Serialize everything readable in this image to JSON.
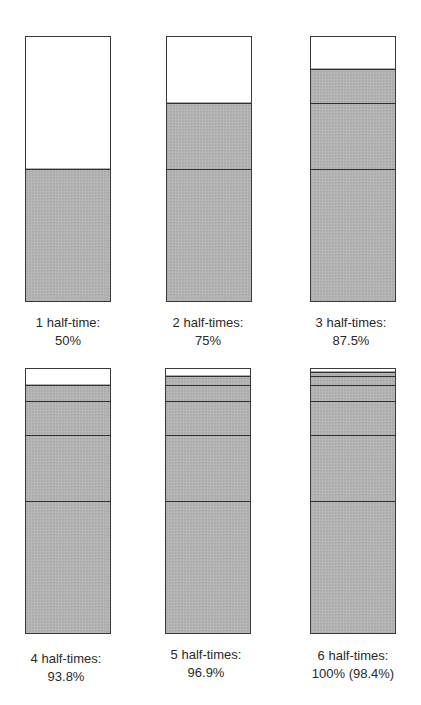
{
  "diagram": {
    "colors": {
      "filled": "#b4b4b4",
      "empty": "#ffffff",
      "line": "#2f2f2f"
    },
    "panels": [
      {
        "label_line1": "1 half-time:",
        "label_line2": "50%",
        "segments": [
          50
        ]
      },
      {
        "label_line1": "2 half-times:",
        "label_line2": "75%",
        "segments": [
          50,
          25
        ]
      },
      {
        "label_line1": "3 half-times:",
        "label_line2": "87.5%",
        "segments": [
          50,
          25,
          12.5
        ]
      },
      {
        "label_line1": "4 half-times:",
        "label_line2": "93.8%",
        "segments": [
          50,
          25,
          12.5,
          6.25
        ]
      },
      {
        "label_line1": "5 half-times:",
        "label_line2": "96.9%",
        "segments": [
          50,
          25,
          12.5,
          6.25,
          3.125
        ]
      },
      {
        "label_line1": "6 half-times:",
        "label_line2": "100% (98.4%)",
        "segments": [
          50,
          25,
          12.5,
          6.25,
          3.125,
          1.5625
        ]
      }
    ]
  }
}
